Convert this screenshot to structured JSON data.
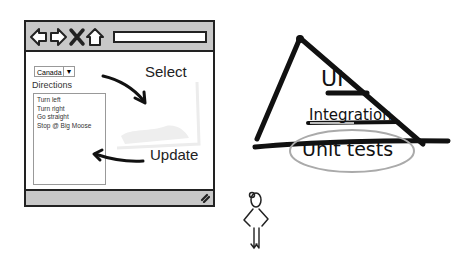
{
  "browser": {
    "nav_icons": [
      "back-arrow-icon",
      "forward-arrow-icon",
      "stop-x-icon",
      "home-icon"
    ],
    "url_value": "",
    "country_select": {
      "selected": "Canada",
      "arrow": "▼"
    },
    "directions_label": "Directions",
    "directions": [
      "Turn left",
      "Turn right",
      "Go straight",
      "Stop @ Big Moose"
    ],
    "status_icon": "resize-grip-icon"
  },
  "annotations": {
    "select_label": "Select",
    "update_label": "Update"
  },
  "pyramid": {
    "levels": [
      {
        "label": "UI"
      },
      {
        "label": "Integration"
      },
      {
        "label": "Unit tests",
        "highlighted": true
      }
    ]
  },
  "figure": {
    "icon": "stick-figure-icon"
  }
}
